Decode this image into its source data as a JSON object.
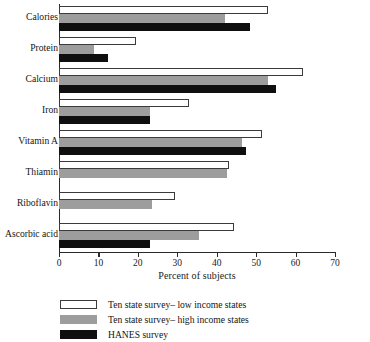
{
  "chart_data": {
    "type": "bar",
    "orientation": "horizontal",
    "title": "",
    "xlabel": "Percent of subjects",
    "ylabel": "",
    "xlim": [
      0,
      70
    ],
    "xticks": [
      0,
      10,
      20,
      30,
      40,
      50,
      60,
      70
    ],
    "grid": false,
    "legend_position": "below",
    "categories": [
      "Calories",
      "Protein",
      "Calcium",
      "Iron",
      "Vitamin A",
      "Thiamin",
      "Riboflavin",
      "Ascorbic acid"
    ],
    "series": [
      {
        "name": "Ten state survey– low income states",
        "color": "#ffffff",
        "values": [
          53,
          19.5,
          62,
          33,
          51.5,
          43,
          29.5,
          44.5
        ]
      },
      {
        "name": "Ten state survey– high income states",
        "color": "#9d9d9d",
        "values": [
          42,
          9,
          53,
          23,
          46.5,
          42.5,
          23.5,
          35.5
        ]
      },
      {
        "name": "HANES survey",
        "color": "#100f0f",
        "values": [
          48.5,
          12.5,
          55,
          23,
          47.5,
          null,
          null,
          23
        ]
      }
    ]
  },
  "axis": {
    "x_title": "Percent of subjects",
    "tick_labels": [
      "0",
      "10",
      "20",
      "30",
      "40",
      "50",
      "60",
      "70"
    ]
  },
  "legend": {
    "items": [
      {
        "label": "Ten state survey– low income states",
        "swatch": "low"
      },
      {
        "label": "Ten state survey– high income states",
        "swatch": "high"
      },
      {
        "label": "HANES survey",
        "swatch": "hanes"
      }
    ]
  }
}
